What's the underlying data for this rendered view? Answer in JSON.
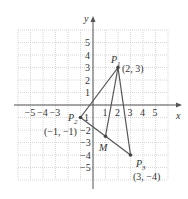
{
  "diagram": {
    "type": "coordinate-plane",
    "axes": {
      "x_label": "x",
      "y_label": "y",
      "x_ticks": [
        "-5",
        "-4",
        "-3",
        "1",
        "2",
        "3",
        "4",
        "5"
      ],
      "y_ticks": [
        "5",
        "4",
        "3",
        "2",
        "1",
        "-1",
        "-2",
        "-3",
        "-4",
        "-5"
      ],
      "range": [
        -6,
        6
      ]
    },
    "points": [
      {
        "name": "P",
        "sub": "1",
        "coord_label": "(2, 3)",
        "x": 2,
        "y": 3
      },
      {
        "name": "P",
        "sub": "2",
        "coord_label": "(−1, −1)",
        "x": -1,
        "y": -1
      },
      {
        "name": "P",
        "sub": "3",
        "coord_label": "(3, −4)",
        "x": 3,
        "y": -4
      },
      {
        "name": "M",
        "sub": "",
        "coord_label": "",
        "x": 1,
        "y": -2.5
      }
    ],
    "segments": [
      [
        "P1",
        "P2"
      ],
      [
        "P2",
        "P3"
      ],
      [
        "P1",
        "P3"
      ],
      [
        "P1",
        "M"
      ]
    ]
  }
}
